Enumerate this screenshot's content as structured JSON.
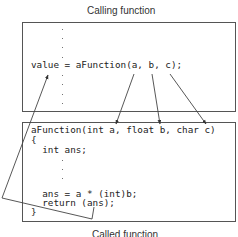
{
  "diagram": {
    "caller": {
      "label": "Calling function",
      "code_line": "value = aFunction(a, b, c);"
    },
    "callee": {
      "label": "Called function",
      "lines": [
        "aFunction(int a, float b, char c)",
        "{",
        "  int ans;",
        "  ans = a * (int)b;",
        "  return (ans);",
        "}"
      ]
    },
    "arrows": [
      {
        "from": "a (call argument)",
        "to": "int a (parameter)"
      },
      {
        "from": "b (call argument)",
        "to": "float b (parameter)"
      },
      {
        "from": "c (call argument)",
        "to": "char c (parameter)"
      },
      {
        "from": "return (ans)",
        "to": "value"
      }
    ],
    "colors": {
      "line": "#444444",
      "text": "#222222"
    }
  }
}
